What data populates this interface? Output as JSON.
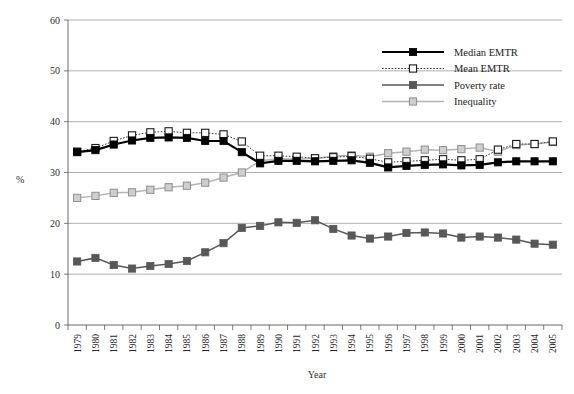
{
  "chart_data": {
    "type": "line",
    "title": "",
    "xlabel": "Year",
    "ylabel": "%",
    "ylim": [
      0,
      60
    ],
    "yticks": [
      0,
      10,
      20,
      30,
      40,
      50,
      60
    ],
    "grid": true,
    "legend_position": "top-right",
    "categories": [
      "1979",
      "1980",
      "1981",
      "1982",
      "1983",
      "1984",
      "1985",
      "1986",
      "1987",
      "1988",
      "1989",
      "1990",
      "1991",
      "1992",
      "1993",
      "1994",
      "1995",
      "1996",
      "1997",
      "1998",
      "1999",
      "2000",
      "2001",
      "2002",
      "2003",
      "2004",
      "2005"
    ],
    "series": [
      {
        "name": "Median EMTR",
        "color": "#000000",
        "line_style": "solid",
        "marker": "filled-square",
        "values": [
          34.0,
          34.4,
          35.5,
          36.3,
          36.8,
          36.9,
          36.8,
          36.2,
          36.2,
          34.0,
          31.8,
          32.3,
          32.3,
          32.2,
          32.3,
          32.4,
          31.9,
          31.0,
          31.3,
          31.5,
          31.6,
          31.4,
          31.5,
          32.0,
          32.2,
          32.2,
          32.2
        ]
      },
      {
        "name": "Mean EMTR",
        "color": "#333333",
        "line_style": "dotted",
        "marker": "open-square",
        "values": [
          34.1,
          34.8,
          36.2,
          37.3,
          37.9,
          38.1,
          37.8,
          37.8,
          37.5,
          36.1,
          33.3,
          33.3,
          33.1,
          32.8,
          33.0,
          33.2,
          32.7,
          32.0,
          32.2,
          32.4,
          32.6,
          32.4,
          32.6,
          34.5,
          35.6,
          35.6,
          36.1
        ]
      },
      {
        "name": "Poverty rate",
        "color": "#585858",
        "line_style": "solid",
        "marker": "filled-square",
        "values": [
          12.5,
          13.2,
          11.8,
          11.1,
          11.6,
          12.0,
          12.6,
          14.3,
          16.1,
          19.1,
          19.5,
          20.2,
          20.1,
          20.6,
          18.9,
          17.6,
          17.0,
          17.4,
          18.1,
          18.2,
          18.0,
          17.2,
          17.4,
          17.2,
          16.8,
          16.0,
          15.8
        ]
      },
      {
        "name": "Inequality",
        "color": "#b4b4b4",
        "line_style": "solid",
        "marker": "shaded-square",
        "values": [
          25.0,
          25.4,
          26.0,
          26.1,
          26.6,
          27.1,
          27.4,
          28.0,
          29.0,
          30.0,
          32.3,
          32.7,
          32.6,
          32.8,
          33.2,
          33.4,
          33.1,
          33.8,
          34.1,
          34.5,
          34.4,
          34.6,
          34.9,
          34.1,
          35.4,
          35.6,
          36.0
        ]
      }
    ]
  },
  "legend": {
    "items": [
      {
        "label": "Median EMTR"
      },
      {
        "label": "Mean EMTR"
      },
      {
        "label": "Poverty rate"
      },
      {
        "label": "Inequality"
      }
    ]
  },
  "footnote": {
    "text": ""
  }
}
